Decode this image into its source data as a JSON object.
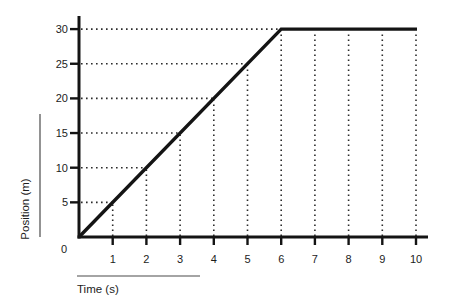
{
  "chart_data": {
    "type": "line",
    "title": "",
    "xlabel": "Time (s)",
    "ylabel": "Position (m)",
    "origin_label": "0",
    "x_ticks": [
      1,
      2,
      3,
      4,
      5,
      6,
      7,
      8,
      9,
      10
    ],
    "x_tick_labels": [
      "1",
      "2",
      "3",
      "4",
      "5",
      "6",
      "7",
      "8",
      "9",
      "10"
    ],
    "y_ticks": [
      5,
      10,
      15,
      20,
      25,
      30
    ],
    "y_tick_labels": [
      "5",
      "10",
      "15",
      "20",
      "25",
      "30"
    ],
    "xlim": [
      0,
      10
    ],
    "ylim": [
      0,
      30
    ],
    "series": [
      {
        "name": "position-vs-time",
        "points": [
          [
            0,
            0
          ],
          [
            6,
            30
          ],
          [
            10,
            30
          ]
        ],
        "description": "Position rises linearly from 0 m at 0 s to 30 m at 6 s, then remains constant at 30 m until 10 s"
      }
    ],
    "grid": "dotted lines from each axis tick up/across to the curve",
    "line_color": "#141414",
    "axis_color": "#141414",
    "dot_grid_color": "#2b2b2b",
    "rule_color": "#4a4a4a",
    "text_color": "#1c1c1c"
  }
}
